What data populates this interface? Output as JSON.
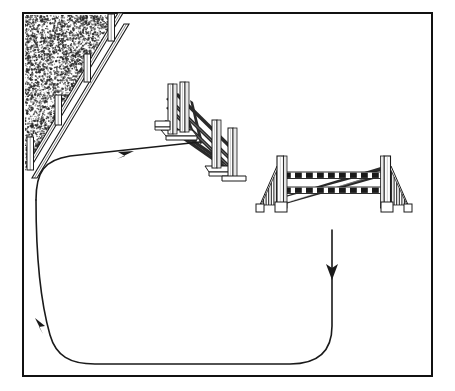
{
  "figure": {
    "kind": "equestrian-show-jumping-course-diagram",
    "style": "black-and-white-line-art",
    "background_color": "#ffffff",
    "ink_color": "#111111",
    "fill_color": "#ffffff",
    "shade_color": "#8f8f8f",
    "border": {
      "name": "arena-border",
      "x": 23,
      "y": 13,
      "width": 409,
      "height": 363,
      "stroke_width": 2
    }
  },
  "scenery": {
    "textured_corner": {
      "name": "hedge-texture-area",
      "description": "stippled triangular hedge/brush mass in upper-left corner",
      "points": "25,15 118,15 25,172",
      "dot_color": "#2b2b2b",
      "dot_count": 2600
    },
    "boundary_fence": {
      "name": "diagonal-post-and-rail-fence",
      "description": "post and rail fence running diagonally from upper-right down to lower-left along the hedge edge",
      "rail_count": 2,
      "post_count": 4,
      "posts": [
        {
          "x": 111,
          "y": 16,
          "height": 26
        },
        {
          "x": 87,
          "y": 56,
          "height": 28
        },
        {
          "x": 58,
          "y": 96,
          "height": 30
        },
        {
          "x": 30,
          "y": 138,
          "height": 32
        }
      ]
    }
  },
  "obstacles": [
    {
      "id": "jump-1",
      "name": "jump-obstacle-vertical-planks",
      "label": "Jump 1",
      "type": "vertical",
      "orientation": "angled-away-from-viewer",
      "description": "narrow vertical fence with plank standards and crossed diagonal poles, set at an oblique angle",
      "bbox": {
        "x": 150,
        "y": 80,
        "width": 100,
        "height": 100
      }
    },
    {
      "id": "jump-2",
      "name": "jump-obstacle-oxer-with-wings",
      "label": "Jump 2",
      "type": "oxer",
      "orientation": "facing-viewer",
      "description": "wide spread fence with two fan-shaped wing standards and two striped horizontal rails plus crossed poles",
      "bbox": {
        "x": 255,
        "y": 155,
        "width": 158,
        "height": 58
      },
      "rail_count": 2,
      "rail_pattern": "black-and-white-striped"
    }
  ],
  "path": {
    "name": "riding-track-path",
    "description": "continuous track the horse follows: approaches jump 1 from the left, loops down the right side, and sweeps around the bottom and back up the left side",
    "stroke_width": 1.6,
    "arrows": [
      {
        "name": "arrow-approach-to-jump-1",
        "x": 127,
        "y": 155,
        "direction": "up-right",
        "label": "approach"
      },
      {
        "name": "arrow-descending-after-jump-2",
        "x": 332,
        "y": 271,
        "direction": "down",
        "label": "away"
      },
      {
        "name": "arrow-returning-up-left-side",
        "x": 38,
        "y": 330,
        "direction": "up-left",
        "label": "return"
      }
    ]
  }
}
